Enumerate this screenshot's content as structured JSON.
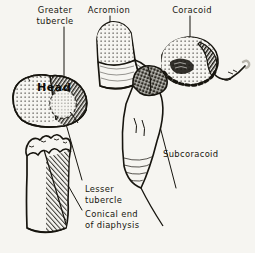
{
  "figure": {
    "background_color": "#f6f5f1",
    "ink_color": "#17150f",
    "style": "pen-and-ink anatomical line drawing with stipple and hatch shading"
  },
  "labels": [
    {
      "id": "greater-tubercle",
      "text": "Greater\ntubercle",
      "x": 20,
      "y": 5,
      "align": "center"
    },
    {
      "id": "acromion",
      "text": "Acromion",
      "x": 100,
      "y": 5,
      "align": "center"
    },
    {
      "id": "coracoid",
      "text": "Coracoid",
      "x": 182,
      "y": 5,
      "align": "center"
    },
    {
      "id": "head",
      "text": "Head",
      "x": 37,
      "y": 83,
      "align": "left"
    },
    {
      "id": "subcoracoid",
      "text": "Subcoracoid",
      "x": 163,
      "y": 149,
      "align": "left"
    },
    {
      "id": "lesser-tubercle",
      "text": "Lesser\ntubercle",
      "x": 85,
      "y": 184,
      "align": "left"
    },
    {
      "id": "conical-end",
      "text": "Conical end\nof diaphysis",
      "x": 85,
      "y": 209,
      "align": "left"
    }
  ],
  "structures": [
    {
      "id": "humeral-head",
      "name": "Head of humerus",
      "shading": "stipple + dense hatch"
    },
    {
      "id": "humeral-shaft",
      "name": "Conical end of diaphysis",
      "shading": "line hatch, jagged fracture edge"
    },
    {
      "id": "acromion-process",
      "name": "Acromion",
      "shading": "stipple cap over smooth body"
    },
    {
      "id": "coracoid-process",
      "name": "Coracoid",
      "shading": "stipple with dashed dark margin"
    },
    {
      "id": "subcoracoid-wedge",
      "name": "Subcoracoid centre",
      "shading": "dark crosshatch wedge"
    },
    {
      "id": "glenoid-neck",
      "name": "Glenoid / neck of scapula",
      "shading": "outline with fine hatch"
    },
    {
      "id": "coracoid-hook",
      "name": "Hooked coracoid tip",
      "shading": "outline"
    }
  ],
  "leaders": [
    {
      "id": "leader-greater-tubercle",
      "from": "greater-tubercle",
      "to": "humeral-head"
    },
    {
      "id": "leader-acromion",
      "from": "acromion",
      "to": "acromion-process"
    },
    {
      "id": "leader-coracoid",
      "from": "coracoid",
      "to": "coracoid-process"
    },
    {
      "id": "leader-lesser-tubercle",
      "from": "lesser-tubercle",
      "to": "humeral-head"
    },
    {
      "id": "leader-conical-end",
      "from": "conical-end",
      "to": "humeral-shaft"
    },
    {
      "id": "leader-subcoracoid",
      "from": "subcoracoid",
      "to": "subcoracoid-wedge"
    }
  ],
  "caption": {
    "text": "",
    "visible": false
  }
}
